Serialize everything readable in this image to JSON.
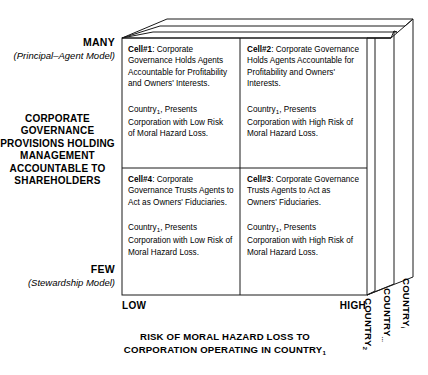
{
  "diagram": {
    "y_axis": {
      "top_label": "MANY",
      "top_sublabel": "(Principal–Agent Model)",
      "title": "CORPORATE GOVERNANCE PROVISIONS HOLDING MANAGEMENT ACCOUNTABLE TO SHAREHOLDERS",
      "bottom_label": "FEW",
      "bottom_sublabel": "(Stewardship Model)"
    },
    "x_axis": {
      "low_label": "LOW",
      "high_label": "HIGH",
      "title_line1": "RISK OF MORAL HAZARD LOSS TO",
      "title_line2": "CORPORATION OPERATING IN COUNTRY",
      "title_subscript": "1"
    },
    "depth_axis": {
      "labels": [
        {
          "text": "COUNTRY",
          "subscript": "2"
        },
        {
          "text": "COUNTRY",
          "subscript": "..."
        },
        {
          "text": "COUNTRY",
          "subscript": "i"
        }
      ]
    },
    "cells": [
      {
        "id": "cell1",
        "label": "Cell#1",
        "label_suffix": ":",
        "paragraph1": "Corporate Governance Holds Agents Accountable for Profitability and Owners' Interests.",
        "paragraph2_pre": "Country",
        "paragraph2_sub": "1",
        "paragraph2_post": ", Presents Corporation with Low Risk of Moral Hazard Loss."
      },
      {
        "id": "cell2",
        "label": "Cell#2",
        "label_suffix": ":",
        "paragraph1": "Corporate Governance Holds Agents Accountable for Profitability and Owners' Interests.",
        "paragraph2_pre": "Country",
        "paragraph2_sub": "1",
        "paragraph2_post": ", Presents Corporation with High Risk of Moral Hazard Loss."
      },
      {
        "id": "cell4",
        "label": "Cell#4",
        "label_suffix": ":",
        "paragraph1": "Corporate Governance Trusts Agents to Act as Owners' Fiduciaries.",
        "paragraph2_pre": "Country",
        "paragraph2_sub": "1",
        "paragraph2_post": ", Presents Corporation with Low Risk of Moral Hazard Loss."
      },
      {
        "id": "cell3",
        "label": "Cell#3",
        "label_suffix": ":",
        "paragraph1": "Corporate Governance Trusts Agents to Act as Owners' Fiduciaries.",
        "paragraph2_pre": "Country",
        "paragraph2_sub": "1",
        "paragraph2_post": ", Presents Corporation with High Risk of Moral Hazard Loss."
      }
    ],
    "colors": {
      "stroke": "#1a1a1a",
      "background": "#ffffff",
      "text": "#000000"
    }
  }
}
